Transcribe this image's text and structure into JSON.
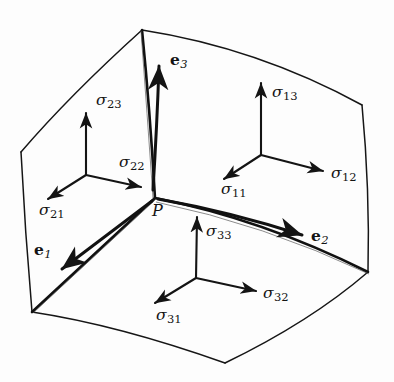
{
  "figure": {
    "background_color": "#fdfdfd",
    "ink_color": "#141414",
    "point_label": "P",
    "faces": [
      {
        "name": "face-2-left",
        "normal_index": "2",
        "components": [
          "sigma_21",
          "sigma_22",
          "sigma_23"
        ]
      },
      {
        "name": "face-1-right",
        "normal_index": "1",
        "components": [
          "sigma_11",
          "sigma_12",
          "sigma_13"
        ]
      },
      {
        "name": "face-3-bottom",
        "normal_index": "3",
        "components": [
          "sigma_31",
          "sigma_32",
          "sigma_33"
        ]
      }
    ],
    "stress_labels": [
      {
        "name": "sigma-23",
        "symbol": "σ",
        "sub": "23",
        "x": 96,
        "y": 93
      },
      {
        "name": "sigma-22",
        "symbol": "σ",
        "sub": "22",
        "x": 119,
        "y": 155
      },
      {
        "name": "sigma-21",
        "symbol": "σ",
        "sub": "21",
        "x": 39,
        "y": 203
      },
      {
        "name": "sigma-13",
        "symbol": "σ",
        "sub": "13",
        "x": 272,
        "y": 85
      },
      {
        "name": "sigma-12",
        "symbol": "σ",
        "sub": "12",
        "x": 331,
        "y": 166
      },
      {
        "name": "sigma-11",
        "symbol": "σ",
        "sub": "11",
        "x": 221,
        "y": 182
      },
      {
        "name": "sigma-33",
        "symbol": "σ",
        "sub": "33",
        "x": 206,
        "y": 224
      },
      {
        "name": "sigma-32",
        "symbol": "σ",
        "sub": "32",
        "x": 263,
        "y": 286
      },
      {
        "name": "sigma-31",
        "symbol": "σ",
        "sub": "31",
        "x": 156,
        "y": 308
      }
    ],
    "basis_labels": [
      {
        "name": "e3",
        "symbol": "e",
        "sub": "3",
        "x": 170,
        "y": 52
      },
      {
        "name": "e2",
        "symbol": "e",
        "sub": "2",
        "x": 311,
        "y": 228
      },
      {
        "name": "e1",
        "symbol": "e",
        "sub": "1",
        "x": 34,
        "y": 242
      }
    ],
    "point": {
      "name": "point-P",
      "label": "P",
      "x": 152,
      "y": 203
    },
    "geometry": {
      "outline_vertices": "142,30 21,152 32,312 225,363 368,272 362,105",
      "junction": [
        155,
        198
      ],
      "triad_origins": {
        "face2": [
          86,
          175
        ],
        "face1": [
          261,
          155
        ],
        "face3": [
          195,
          278
        ]
      }
    }
  }
}
